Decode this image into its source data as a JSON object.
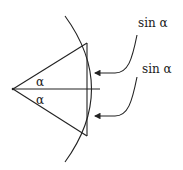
{
  "diagram": {
    "labels": {
      "angle_upper": "α",
      "angle_lower": "α",
      "sin_upper": "sin α",
      "sin_lower": "sin α"
    },
    "colors": {
      "stroke": "#222222",
      "background": "#ffffff"
    }
  }
}
